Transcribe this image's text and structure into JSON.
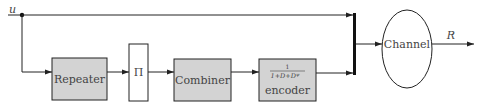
{
  "diagram": {
    "input_label": "u",
    "output_label": "R",
    "blocks": {
      "repeater": {
        "label": "Repeater",
        "fill": "#d3d3d3"
      },
      "interleaver": {
        "label": "Π",
        "fill": "#ffffff"
      },
      "combiner": {
        "label": "Combiner",
        "fill": "#d3d3d3"
      },
      "encoder": {
        "numerator": "1",
        "denominator": "1+D+D^ψ",
        "denominator_base": "1+D+D",
        "denominator_exp": "ψ",
        "label": "encoder",
        "fill": "#d3d3d3"
      },
      "channel": {
        "label": "Channel",
        "fill": "#ffffff"
      }
    },
    "colors": {
      "stroke": "#222222",
      "text": "#444444",
      "block_fill": "#d3d3d3"
    }
  }
}
